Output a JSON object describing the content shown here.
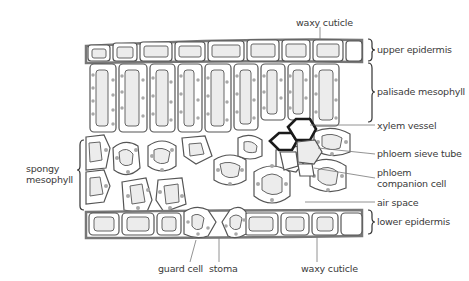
{
  "diagram": {
    "labels": {
      "waxy_cuticle_top": "waxy cuticle",
      "upper_epidermis": "upper epidermis",
      "palisade_mesophyll": "palisade mesophyll",
      "xylem_vessel": "xylem vessel",
      "phloem_sieve_tube": "phloem sieve tube",
      "phloem_companion_line1": "phloem",
      "phloem_companion_line2": "companion cell",
      "air_space": "air space",
      "lower_epidermis": "lower epidermis",
      "spongy_line1": "spongy",
      "spongy_line2": "mesophyll",
      "guard_cell": "guard cell",
      "stoma": "stoma",
      "waxy_cuticle_bottom": "waxy cuticle"
    },
    "colors": {
      "outline": "#555555",
      "cell_fill": "#ffffff",
      "vacuole_fill": "#ececec",
      "chloroplast": "#a8a8a8",
      "xylem": "#1a1a1a",
      "leader_line": "#777777"
    }
  }
}
